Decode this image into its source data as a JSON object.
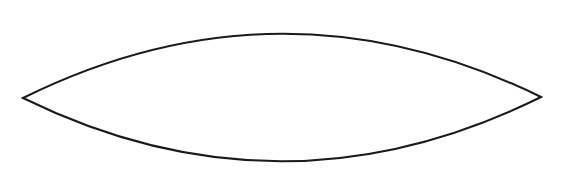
{
  "figure": {
    "canvas": {
      "width": 564,
      "height": 185,
      "background_color": "#ffffff"
    },
    "shape": {
      "name": "lens",
      "description": "vesica-piscis lens formed by two symmetric circular arcs meeting at left and right cusps",
      "stroke_color": "#1a1a1a",
      "stroke_width": 2,
      "fill": "none",
      "left_vertex": {
        "x": 23,
        "y": 98
      },
      "right_vertex": {
        "x": 541,
        "y": 97
      },
      "top_apex": {
        "x": 282,
        "y": 22
      },
      "bottom_apex": {
        "x": 282,
        "y": 173
      },
      "width": 518,
      "height": 151,
      "path": "M 23 98 Q 282 -30 541 97 Q 282 225 23 98 Z"
    }
  }
}
